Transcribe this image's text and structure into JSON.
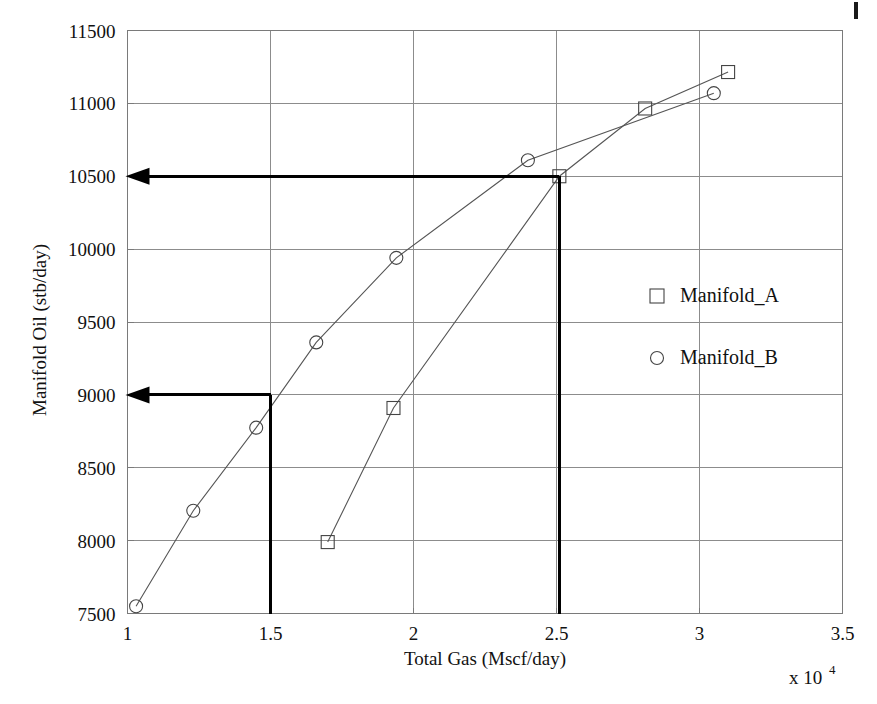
{
  "figure": {
    "background_color": "#ffffff",
    "frame_color": "#7a7a7a",
    "grid_color": "#8c8c8c",
    "series_line_color": "#555555",
    "marker_edge_color": "#444444",
    "annotation_color": "#000000"
  },
  "axes": {
    "y_label": "Manifold Oil (stb/day)",
    "x_label": "Total Gas (Mscf/day)",
    "x_multiplier_base": "x 10",
    "x_multiplier_exponent": "4",
    "y_ticks": [
      "7500",
      "8000",
      "8500",
      "9000",
      "9500",
      "10000",
      "10500",
      "11000",
      "11500"
    ],
    "x_ticks": [
      "1",
      "1.5",
      "2",
      "2.5",
      "3",
      "3.5"
    ]
  },
  "legend": {
    "position": "inside-right",
    "entries": [
      {
        "label": "Manifold_A",
        "marker": "square-marker"
      },
      {
        "label": "Manifold_B",
        "marker": "circle-marker"
      }
    ]
  },
  "annotations": [
    {
      "name": "operating-point-b",
      "arrow_label": "9000",
      "x_value": 1.5,
      "y_value": 9000,
      "has_vertical_drop": true,
      "has_horizontal_arrow": true
    },
    {
      "name": "operating-point-a",
      "arrow_label": "10500",
      "x_value": 2.51,
      "y_value": 10500,
      "has_vertical_drop": true,
      "has_horizontal_arrow": true
    }
  ],
  "chart_data": {
    "type": "line",
    "title": "",
    "xlabel": "Total Gas (Mscf/day)",
    "ylabel": "Manifold Oil (stb/day)",
    "xlim": [
      1,
      3.5
    ],
    "ylim": [
      7500,
      11500
    ],
    "x_scale_multiplier": 10000,
    "grid": true,
    "legend_position": "inside-right",
    "series": [
      {
        "name": "Manifold_A",
        "marker": "square",
        "points": [
          {
            "x": 1.7,
            "y": 7990
          },
          {
            "x": 1.93,
            "y": 8910
          },
          {
            "x": 2.51,
            "y": 10500
          },
          {
            "x": 2.81,
            "y": 10965
          },
          {
            "x": 3.1,
            "y": 11215
          }
        ]
      },
      {
        "name": "Manifold_B",
        "marker": "circle",
        "points": [
          {
            "x": 1.03,
            "y": 7550
          },
          {
            "x": 1.23,
            "y": 8205
          },
          {
            "x": 1.45,
            "y": 8775
          },
          {
            "x": 1.66,
            "y": 9360
          },
          {
            "x": 1.94,
            "y": 9940
          },
          {
            "x": 2.4,
            "y": 10610
          },
          {
            "x": 3.05,
            "y": 11070
          }
        ]
      }
    ]
  }
}
